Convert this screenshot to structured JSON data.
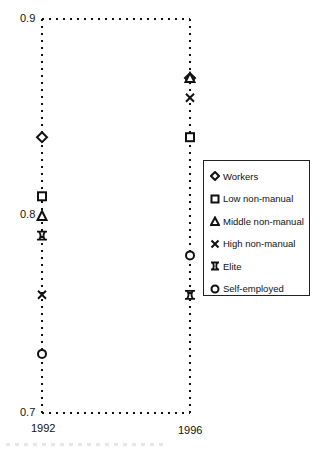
{
  "chart_data": {
    "type": "scatter",
    "title": "",
    "xlabel": "",
    "ylabel": "",
    "x": [
      1992,
      1996
    ],
    "x_tick_labels": [
      "1992",
      "1996"
    ],
    "y_tick_labels": [
      "0.9",
      "0.8",
      "0.7"
    ],
    "ylim": [
      0.7,
      0.9
    ],
    "grid": false,
    "frame": "dotted",
    "legend_position": "right",
    "series": [
      {
        "name": "Workers",
        "marker": "diamond",
        "values": [
          0.84,
          0.87
        ]
      },
      {
        "name": "Low non-manual",
        "marker": "square",
        "values": [
          0.81,
          0.84
        ]
      },
      {
        "name": "Middle non-manual",
        "marker": "triangle",
        "values": [
          0.8,
          0.87
        ]
      },
      {
        "name": "High non-manual",
        "marker": "x",
        "values": [
          0.76,
          0.86
        ]
      },
      {
        "name": "Elite",
        "marker": "hourglass-square",
        "values": [
          0.79,
          0.76
        ]
      },
      {
        "name": "Self-employed",
        "marker": "circle",
        "values": [
          0.73,
          0.78
        ]
      }
    ]
  },
  "axis": {
    "y_top": "0.9",
    "y_mid": "0.8",
    "y_bottom": "0.7",
    "x_left": "1992",
    "x_right": "1996"
  },
  "legend": {
    "items": [
      {
        "label": "Workers"
      },
      {
        "label": "Low non-manual"
      },
      {
        "label": "Middle non-manual"
      },
      {
        "label": "High non-manual"
      },
      {
        "label": "Elite"
      },
      {
        "label": "Self-employed"
      }
    ]
  }
}
